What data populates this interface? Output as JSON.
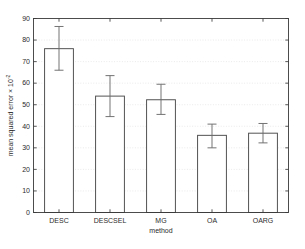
{
  "chart_data": {
    "type": "bar",
    "title": "",
    "xlabel": "method",
    "ylabel": "mean squared error × 10",
    "ylabel_exponent": "-2",
    "categories": [
      "DESC",
      "DESCSEL",
      "MG",
      "OA",
      "OARG"
    ],
    "values": [
      76.0,
      54.0,
      52.3,
      35.8,
      36.8
    ],
    "error_low": [
      66.0,
      44.5,
      45.5,
      30.0,
      32.3
    ],
    "error_high": [
      86.3,
      63.5,
      59.5,
      41.0,
      41.3
    ],
    "ylim": [
      0,
      90
    ],
    "yticks": [
      0,
      10,
      20,
      30,
      40,
      50,
      60,
      70,
      80,
      90
    ],
    "ytick_labels": [
      "0",
      "10",
      "20",
      "30",
      "40",
      "50",
      "60",
      "70",
      "80",
      "90"
    ],
    "grid": true,
    "grid_axis": "y",
    "legend": false,
    "legend_position": "none",
    "bar_facecolor": "#ffffff",
    "bar_edgecolor": "#4a4a4a",
    "error_color": "#6b6b6b",
    "grid_color": "#d9d9d9",
    "axis_color": "#3a3a3a",
    "background_color": "#ffffff"
  },
  "figure": {
    "name": "mean-squared-error-bar-chart"
  }
}
